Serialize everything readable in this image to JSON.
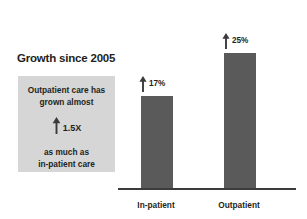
{
  "chart_data": {
    "type": "bar",
    "title": "Growth since 2005",
    "xlabel": "",
    "ylabel": "",
    "categories": [
      "In-patient",
      "Outpatient"
    ],
    "values": [
      17,
      25
    ],
    "value_labels": [
      "17%",
      "25%"
    ],
    "value_unit": "%",
    "ylim": [
      0,
      29
    ],
    "grid": false,
    "legend": false,
    "bar_color": "#5a5a5a",
    "axis_color": "#3b3b3b",
    "marker_icon": "up-arrow-icon",
    "annotation": {
      "background": "#d6d6d6",
      "line1": "Outpatient care has",
      "line2": "grown almost",
      "multiplier": "1.5X",
      "multiplier_icon": "up-arrow-icon",
      "line3": "as much as",
      "line4": "in-patient care"
    }
  }
}
